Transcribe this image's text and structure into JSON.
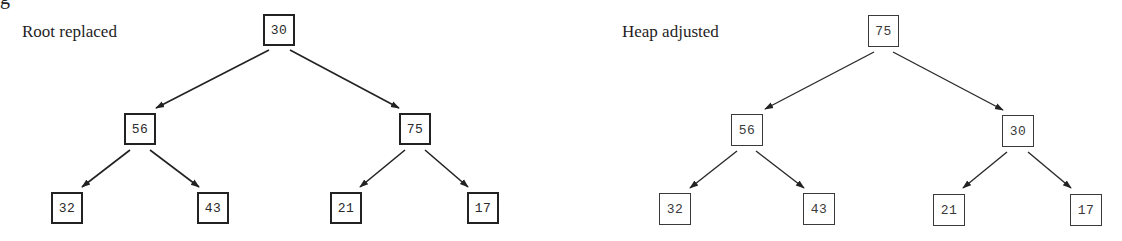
{
  "figure": {
    "fragment_text": "g",
    "panels": [
      {
        "id": "left",
        "caption": "Root replaced",
        "nodes": [
          {
            "id": "root",
            "value": "30"
          },
          {
            "id": "l",
            "value": "56"
          },
          {
            "id": "r",
            "value": "75"
          },
          {
            "id": "ll",
            "value": "32"
          },
          {
            "id": "lr",
            "value": "43"
          },
          {
            "id": "rl",
            "value": "21"
          },
          {
            "id": "rr",
            "value": "17"
          }
        ]
      },
      {
        "id": "right",
        "caption": "Heap adjusted",
        "nodes": [
          {
            "id": "root",
            "value": "75"
          },
          {
            "id": "l",
            "value": "56"
          },
          {
            "id": "r",
            "value": "30"
          },
          {
            "id": "ll",
            "value": "32"
          },
          {
            "id": "lr",
            "value": "43"
          },
          {
            "id": "rl",
            "value": "21"
          },
          {
            "id": "rr",
            "value": "17"
          }
        ]
      }
    ],
    "colors": {
      "stroke": "#222222",
      "background": "#ffffff"
    }
  }
}
